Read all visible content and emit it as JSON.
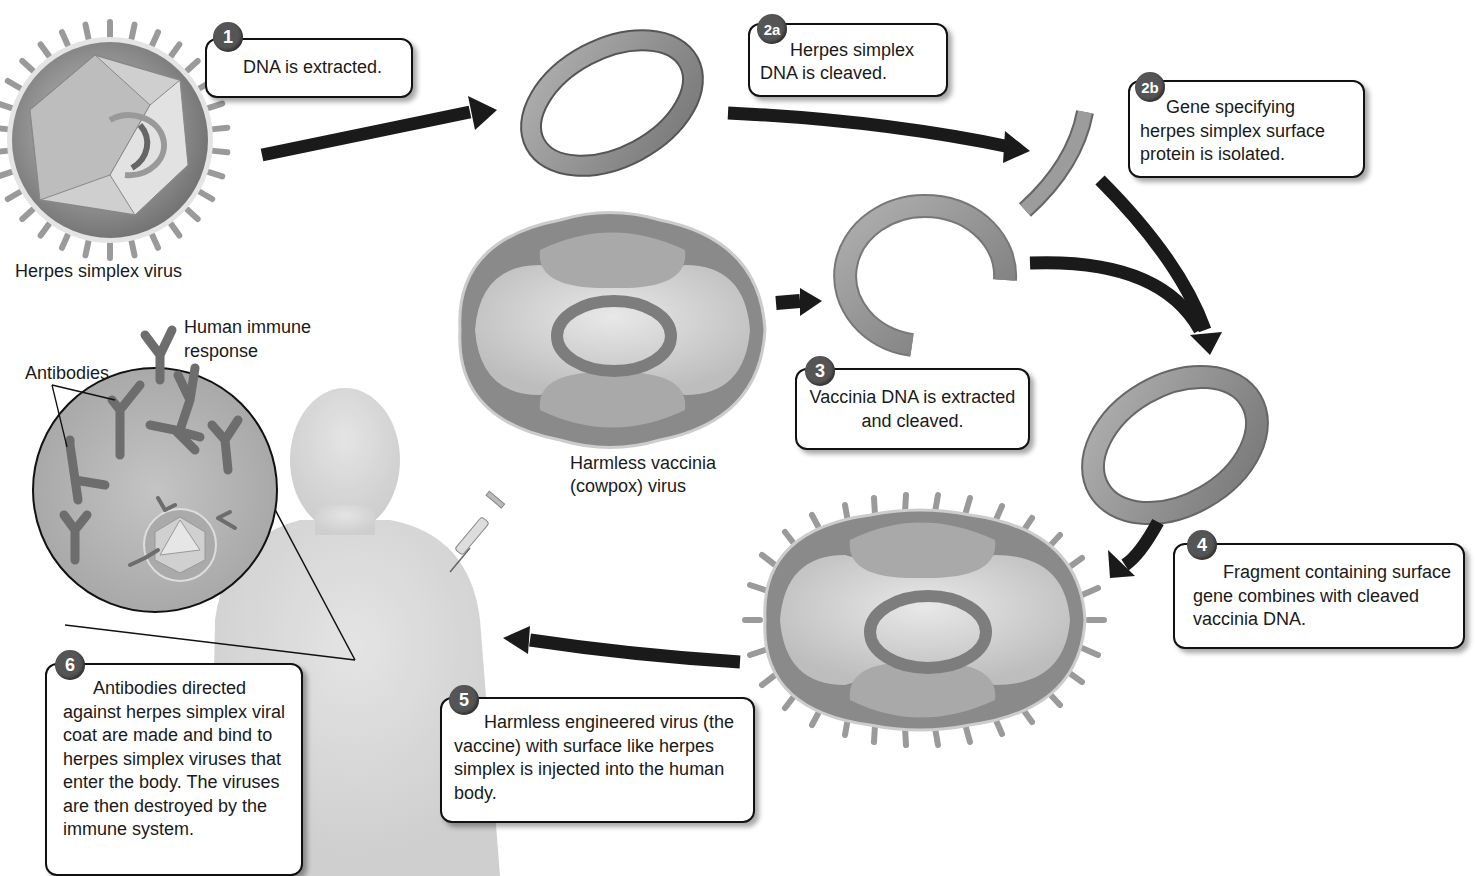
{
  "diagram": {
    "steps": [
      {
        "id": "1",
        "text": "DNA is extracted."
      },
      {
        "id": "2a",
        "text": "Herpes simplex DNA is cleaved."
      },
      {
        "id": "2b",
        "text": "Gene specifying herpes simplex surface protein is isolated."
      },
      {
        "id": "3",
        "text": "Vaccinia DNA is extracted and cleaved."
      },
      {
        "id": "4",
        "text": "Fragment containing surface gene combines with cleaved vaccinia DNA."
      },
      {
        "id": "5",
        "text": "Harmless engineered virus (the vaccine) with surface like herpes simplex is injected into the human body."
      },
      {
        "id": "6",
        "text": "Antibodies directed against herpes simplex viral coat are made and bind to herpes simplex viruses that enter the body. The viruses are then destroyed by the immune system."
      }
    ],
    "labels": {
      "herpes_virus": "Herpes simplex virus",
      "vaccinia_virus_line1": "Harmless vaccinia",
      "vaccinia_virus_line2": "(cowpox) virus",
      "immune_line1": "Human immune",
      "immune_line2": "response",
      "antibodies": "Antibodies"
    },
    "colors": {
      "arrow": "#1a1a1a",
      "dna": "#8a8a8a",
      "virus_body": "#d6d6d6",
      "badge": "#555555"
    }
  }
}
